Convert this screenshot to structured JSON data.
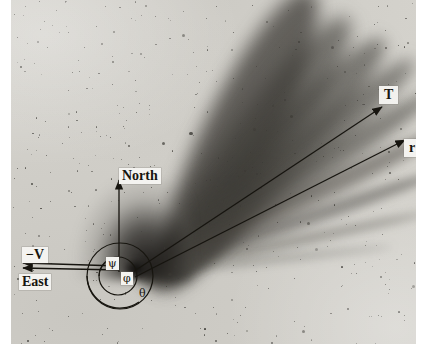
{
  "figure": {
    "kind": "astronomical-photographic-negative",
    "plate": {
      "background_hex": "#cfcdc7",
      "paper_margin_hex": "#ffffff",
      "ink_hex": "#17150f",
      "label_box_hex": "#f4f3f0"
    }
  },
  "labels": {
    "north": "North",
    "east": "East",
    "antisolar_velocity": "−V",
    "tail_axis": "T",
    "sun_radius_vector": "r",
    "angle_psi": "ψ",
    "angle_phi": "φ",
    "angle_theta": "θ"
  },
  "annotations": [
    {
      "name": "north-arrow",
      "label": "North",
      "direction": "up",
      "from": [
        119,
        270
      ],
      "to": [
        119,
        178
      ]
    },
    {
      "name": "tail-axis-arrow",
      "label": "T",
      "direction": "upper-right",
      "from": [
        134,
        272
      ],
      "to": [
        381,
        106
      ]
    },
    {
      "name": "radius-vector-arrow",
      "label": "r",
      "direction": "upper-right",
      "from": [
        134,
        276
      ],
      "to": [
        404,
        140
      ]
    },
    {
      "name": "antisolar-velocity-arrow",
      "label": "−V",
      "direction": "left",
      "from": [
        118,
        266
      ],
      "to": [
        22,
        263
      ]
    },
    {
      "name": "east-arrow",
      "label": "East",
      "direction": "left",
      "from": [
        118,
        270
      ],
      "to": [
        22,
        270
      ]
    }
  ],
  "angle_arcs": [
    {
      "name": "angle-arc-psi",
      "symbol": "ψ",
      "description": "angle between -V direction and tail axis T"
    },
    {
      "name": "angle-arc-phi",
      "symbol": "φ",
      "description": "angle between tail axis T and radius vector r"
    },
    {
      "name": "angle-arc-theta",
      "symbol": "θ",
      "description": "outer angle measured at the nucleus"
    }
  ],
  "circles": [
    {
      "name": "inner-angle-circle",
      "center": [
        118,
        276
      ],
      "radius": 19
    },
    {
      "name": "outer-angle-circle",
      "center": [
        120,
        276
      ],
      "radius": 33
    }
  ],
  "nucleus": {
    "name": "comet-nucleus",
    "position": [
      133,
      270
    ]
  },
  "tail": {
    "name": "dust-tail-fan",
    "origin": [
      133,
      270
    ],
    "opening_angle_deg": 58,
    "streamer_position_angles_deg": [
      -8,
      -18,
      -27,
      -34,
      -41,
      -48,
      -56,
      -63
    ],
    "description": "multiple synchronic dust striae fanning toward upper right"
  }
}
